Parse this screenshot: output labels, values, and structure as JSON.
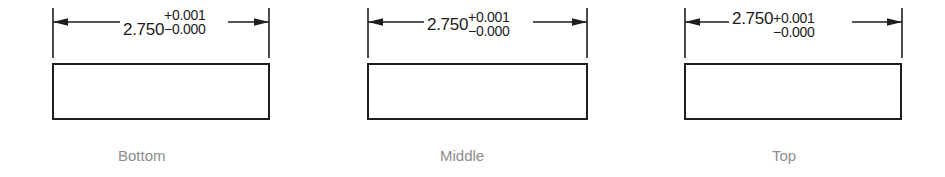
{
  "figure": {
    "line_color": "#1d1d1d",
    "caption_color": "#8d8d8d",
    "background": "#ffffff"
  },
  "groups": [
    {
      "id": "bottom",
      "caption": "Bottom",
      "nominal": "2.750",
      "tolerance_upper": "+0.001",
      "tolerance_lower": "−0.000",
      "alignment": "bottom"
    },
    {
      "id": "middle",
      "caption": "Middle",
      "nominal": "2.750",
      "tolerance_upper": "+0.001",
      "tolerance_lower": "−0.000",
      "alignment": "middle"
    },
    {
      "id": "top",
      "caption": "Top",
      "nominal": "2.750",
      "tolerance_upper": "+0.001",
      "tolerance_lower": "−0.000",
      "alignment": "top"
    }
  ]
}
